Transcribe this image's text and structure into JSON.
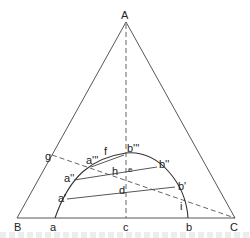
{
  "diagram": {
    "type": "ternary-phase-diagram",
    "vertices": {
      "A": "A",
      "B": "B",
      "C": "C"
    },
    "labels": {
      "A": "A",
      "B": "B",
      "C": "C",
      "a": "a",
      "b": "b",
      "c": "c",
      "a1": "a'",
      "b1": "b'",
      "a2": "a''",
      "b2": "b''",
      "a3": "a'''",
      "b3": "b'''",
      "d": "d",
      "e": "e",
      "f": "f",
      "g": "g",
      "h": "h",
      "i": "i"
    },
    "colors": {
      "line": "#444444",
      "text": "#222222",
      "background": "#ffffff"
    }
  }
}
